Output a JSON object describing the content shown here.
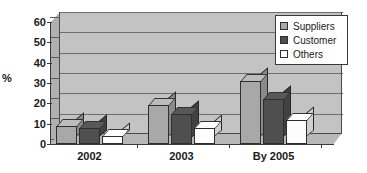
{
  "chart_data": {
    "type": "bar",
    "title": "",
    "subtitle": "",
    "xlabel": "",
    "ylabel": "%",
    "categories": [
      "2002",
      "2003",
      "By 2005"
    ],
    "series": [
      {
        "name": "Suppliers",
        "values": [
          9,
          19,
          31
        ],
        "color": "#a8a8a8"
      },
      {
        "name": "Customer",
        "values": [
          8,
          15,
          22
        ],
        "color": "#4f4f4f"
      },
      {
        "name": "Others",
        "values": [
          4,
          8,
          12
        ],
        "color": "#fdfdfd"
      }
    ],
    "ylim": [
      0,
      60
    ],
    "yticks": [
      0,
      10,
      20,
      30,
      40,
      50,
      60
    ],
    "ytick_labels": [
      "0",
      "10",
      "20",
      "30",
      "40",
      "50",
      "60"
    ],
    "grid": true,
    "grid_axis": "y",
    "legend_position": "top-right",
    "style": "3d-clustered-column",
    "plot_background": "#c3c3c3"
  },
  "legend": {
    "entries": [
      {
        "label": "Suppliers"
      },
      {
        "label": "Customer"
      },
      {
        "label": "Others"
      }
    ]
  },
  "colors": {
    "suppliers": "#a8a8a8",
    "customer": "#4f4f4f",
    "others": "#fdfdfd",
    "plot_wall": "#c3c3c3",
    "gridline": "#6e6e6e",
    "axis": "#3a3a3a",
    "text": "#1a1a1a"
  }
}
